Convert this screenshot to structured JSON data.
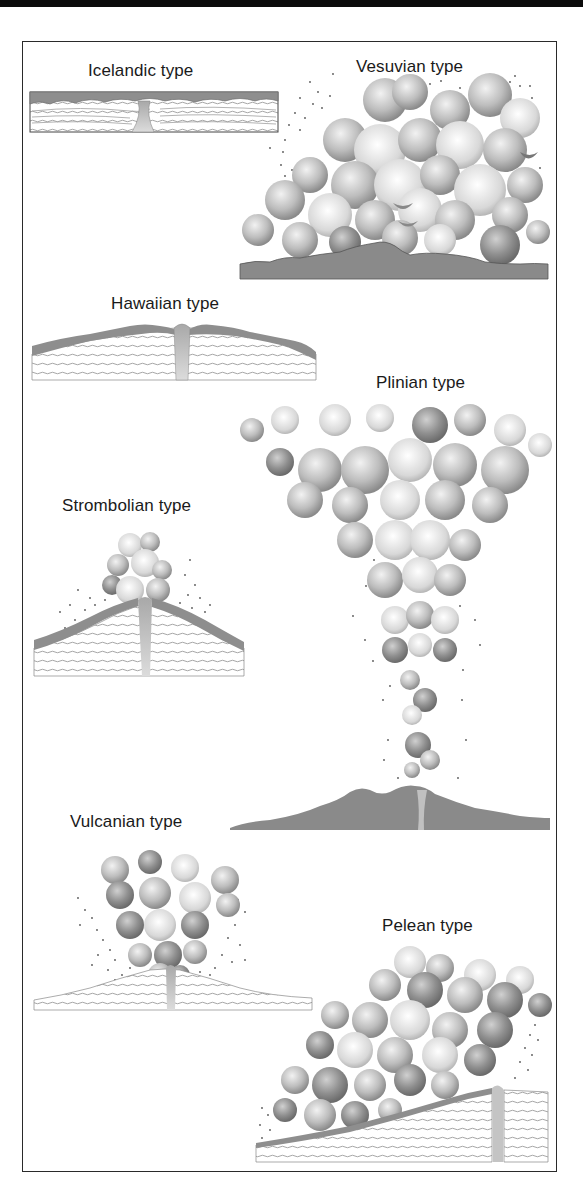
{
  "figure": {
    "panels": [
      {
        "id": "icelandic",
        "label": "Icelandic type"
      },
      {
        "id": "vesuvian",
        "label": "Vesuvian type"
      },
      {
        "id": "hawaiian",
        "label": "Hawaiian type"
      },
      {
        "id": "plinian",
        "label": "Plinian type"
      },
      {
        "id": "strombolian",
        "label": "Strombolian type"
      },
      {
        "id": "vulcanian",
        "label": "Vulcanian type"
      },
      {
        "id": "pelean",
        "label": "Pelean type"
      }
    ]
  },
  "colors": {
    "header_bar": "#0b0b0b",
    "frame_border": "#2a2a2a",
    "lava": "#8e8e8e",
    "strata_line": "#9a9a9a",
    "ash_dark": "#7a7a7a",
    "ash_light": "#e4e4e4",
    "conduit": "#bdbdbd",
    "text": "#1a1a1a"
  }
}
